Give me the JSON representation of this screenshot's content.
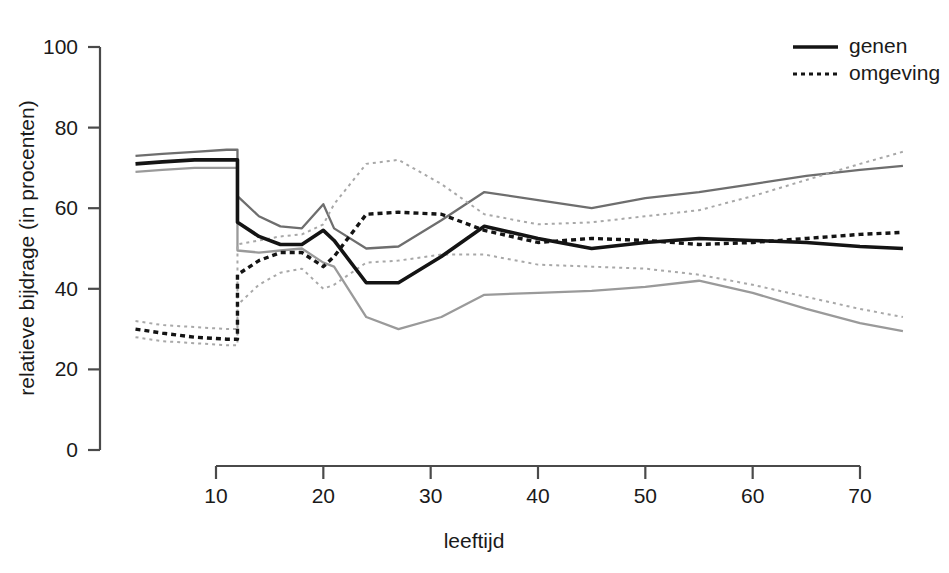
{
  "chart_data": {
    "type": "line",
    "title": "",
    "xlabel": "leeftijd",
    "ylabel": "relatieve bijdrage (in procenten)",
    "xlim": [
      2,
      75
    ],
    "ylim": [
      0,
      100
    ],
    "grid": false,
    "legend_position": "top-right",
    "xticks": [
      10,
      20,
      30,
      40,
      50,
      60,
      70
    ],
    "yticks": [
      0,
      20,
      40,
      60,
      80,
      100
    ],
    "legend": [
      {
        "label": "genen",
        "style": "solid",
        "color": "#141414"
      },
      {
        "label": "omgeving",
        "style": "dotted",
        "color": "#141414"
      }
    ],
    "series": [
      {
        "name": "genen",
        "role": "estimate",
        "style": "solid",
        "width": "bold",
        "color": "#141414",
        "x": [
          2.5,
          5,
          8,
          11,
          12,
          12,
          14,
          16,
          18,
          20,
          21,
          24,
          27,
          31,
          35,
          40,
          45,
          50,
          55,
          60,
          65,
          70,
          74
        ],
        "y": [
          71,
          71.5,
          72,
          72,
          72,
          56.5,
          53,
          51,
          51,
          54.5,
          52,
          41.5,
          41.5,
          48,
          55.5,
          52.5,
          50,
          51.5,
          52.5,
          52,
          51.5,
          50.5,
          50
        ]
      },
      {
        "name": "genen-upper",
        "role": "upper-bound",
        "style": "solid",
        "width": "thin",
        "color": "#6e6e6e",
        "x": [
          2.5,
          5,
          8,
          11,
          12,
          12,
          14,
          16,
          18,
          20,
          21,
          24,
          27,
          31,
          35,
          40,
          45,
          50,
          55,
          60,
          65,
          70,
          74
        ],
        "y": [
          73,
          73.5,
          74,
          74.5,
          74.5,
          63,
          58,
          55.5,
          55,
          61,
          55,
          50,
          50.5,
          57,
          64,
          62,
          60,
          62.5,
          64,
          66,
          68,
          69.5,
          70.5
        ]
      },
      {
        "name": "genen-lower",
        "role": "lower-bound",
        "style": "solid",
        "width": "thin",
        "color": "#9a9a9a",
        "x": [
          2.5,
          5,
          8,
          11,
          12,
          12,
          14,
          16,
          18,
          20,
          21,
          24,
          27,
          31,
          35,
          40,
          45,
          50,
          55,
          60,
          65,
          70,
          74
        ],
        "y": [
          69,
          69.5,
          70,
          70,
          70,
          49.5,
          49,
          49.5,
          50,
          46.5,
          45.5,
          33,
          30,
          33,
          38.5,
          39,
          39.5,
          40.5,
          42,
          39,
          35,
          31.5,
          29.5
        ]
      },
      {
        "name": "omgeving",
        "role": "estimate",
        "style": "dotted",
        "width": "bold",
        "color": "#141414",
        "x": [
          2.5,
          5,
          8,
          11,
          12,
          12,
          14,
          16,
          18,
          20,
          21,
          24,
          27,
          31,
          35,
          40,
          45,
          50,
          55,
          60,
          65,
          70,
          74
        ],
        "y": [
          30,
          29,
          28,
          27.5,
          27.5,
          43.5,
          47,
          49,
          49,
          45.5,
          48,
          58.5,
          59,
          58.5,
          54.5,
          51.5,
          52.5,
          52,
          51,
          51.5,
          52.5,
          53.5,
          54
        ]
      },
      {
        "name": "omgeving-upper",
        "role": "upper-bound",
        "style": "dotted",
        "width": "thin",
        "color": "#a8a8a8",
        "x": [
          2.5,
          5,
          8,
          11,
          12,
          12,
          14,
          16,
          18,
          20,
          21,
          24,
          27,
          31,
          35,
          40,
          45,
          50,
          55,
          60,
          65,
          70,
          74
        ],
        "y": [
          32,
          31,
          30.5,
          30,
          30,
          51,
          52,
          53,
          53.5,
          56,
          61,
          71,
          72,
          66,
          58.5,
          56,
          56.5,
          58,
          59.5,
          63,
          67,
          71,
          74
        ]
      },
      {
        "name": "omgeving-lower",
        "role": "lower-bound",
        "style": "dotted",
        "width": "thin",
        "color": "#a8a8a8",
        "x": [
          2.5,
          5,
          8,
          11,
          12,
          12,
          14,
          16,
          18,
          20,
          21,
          24,
          27,
          31,
          35,
          40,
          45,
          50,
          55,
          60,
          65,
          70,
          74
        ],
        "y": [
          28,
          27,
          26.5,
          26,
          26,
          36,
          41,
          44,
          45,
          40,
          41,
          46.5,
          47,
          48.5,
          48.5,
          46,
          45.5,
          45,
          43.5,
          41,
          38,
          35,
          33
        ]
      }
    ]
  }
}
